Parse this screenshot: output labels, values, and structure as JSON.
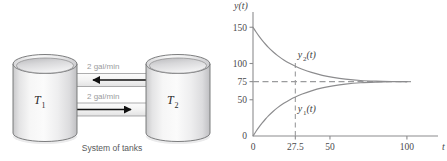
{
  "figure": {
    "background_color": "#ffffff",
    "panels": [
      "tank-diagram",
      "solution-plot"
    ]
  },
  "diagram": {
    "caption": "System of tanks",
    "tank_left_label": "T",
    "tank_left_subscript": "1",
    "tank_right_label": "T",
    "tank_right_subscript": "2",
    "pipe_top_label": "2 gal/min",
    "pipe_bottom_label": "2 gal/min",
    "pipe_top_flow_direction": "left",
    "pipe_bottom_flow_direction": "right",
    "tank_fill_color": "#efefef",
    "tank_outline_color": "#6e6f71",
    "arrow_color": "#1a1a1a",
    "label_color": "#9a9b9d"
  },
  "chart_data": {
    "type": "line",
    "title": "",
    "xlabel": "t",
    "ylabel": "y(t)",
    "xlim": [
      0,
      115
    ],
    "ylim": [
      0,
      160
    ],
    "xticks": [
      0,
      27.5,
      50,
      100
    ],
    "xtick_labels": [
      "0",
      "27.5",
      "50",
      "100"
    ],
    "yticks": [
      0,
      50,
      75,
      100,
      150
    ],
    "ytick_labels": [
      "0",
      "50",
      "75",
      "100",
      "150"
    ],
    "grid": false,
    "legend": "inline-annotations",
    "equilibrium_value": 75,
    "marker_t": 27.5,
    "series": [
      {
        "name": "y_1(t)",
        "label": "y",
        "label_subscript": "1",
        "label_suffix": "(t)",
        "initial_value": 0,
        "limit_value": 75,
        "value_at_marker": 50,
        "color": "#8c8c8e",
        "x": [
          0,
          2,
          4,
          6,
          8,
          10,
          13,
          16,
          20,
          24,
          27.5,
          32,
          38,
          45,
          52,
          60,
          70,
          80,
          90,
          100
        ],
        "y": [
          0,
          6.6,
          12.6,
          18.1,
          23.1,
          27.7,
          33.8,
          39.1,
          45.1,
          50.1,
          53.8,
          57.9,
          62.3,
          66.3,
          69.2,
          71.6,
          73.5,
          74.4,
          74.8,
          74.9
        ]
      },
      {
        "name": "y_2(t)",
        "label": "y",
        "label_subscript": "2",
        "label_suffix": "(t)",
        "initial_value": 150,
        "limit_value": 75,
        "value_at_marker": 100,
        "color": "#8c8c8e",
        "x": [
          0,
          2,
          4,
          6,
          8,
          10,
          13,
          16,
          20,
          24,
          27.5,
          32,
          38,
          45,
          52,
          60,
          70,
          80,
          90,
          100
        ],
        "y": [
          150,
          143.4,
          137.4,
          131.9,
          126.9,
          122.3,
          116.2,
          110.9,
          104.9,
          99.9,
          96.2,
          92.1,
          87.7,
          83.7,
          80.8,
          78.4,
          76.5,
          75.6,
          75.2,
          75.1
        ]
      }
    ],
    "dashed_lines": [
      {
        "orientation": "horizontal",
        "value": 75,
        "color": "#9a9b9d"
      },
      {
        "orientation": "vertical",
        "value": 27.5,
        "color": "#9a9b9d"
      }
    ],
    "axis_color": "#8c8c8e"
  }
}
